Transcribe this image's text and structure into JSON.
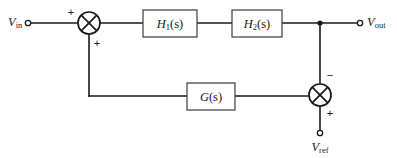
{
  "diagram": {
    "background_color": "#ffffff",
    "line_color": "#1a1a1a",
    "block_stroke_color": "#3c3c3c",
    "blocks": [
      {
        "id": "h1",
        "fn": "H",
        "sub": "1",
        "arg": "(s)",
        "label": "H1(s)"
      },
      {
        "id": "h2",
        "fn": "H",
        "sub": "2",
        "arg": "(s)",
        "label": "H2(s)"
      },
      {
        "id": "g",
        "fn": "G",
        "sub": "",
        "arg": "(s)",
        "label": "G(s)"
      }
    ],
    "signals": [
      {
        "id": "vin",
        "symbol": "V",
        "sub": "in",
        "label": "Vin"
      },
      {
        "id": "vout",
        "symbol": "V",
        "sub": "out",
        "label": "Vout"
      },
      {
        "id": "vref",
        "symbol": "V",
        "sub": "ref",
        "label": "Vref"
      }
    ],
    "summing_junctions": [
      {
        "id": "upper",
        "signs": [
          {
            "position": "left",
            "sign": "+"
          },
          {
            "position": "bottom",
            "sign": "+"
          }
        ]
      },
      {
        "id": "lower",
        "signs": [
          {
            "position": "top",
            "sign": "−"
          },
          {
            "position": "bottom",
            "sign": "+"
          }
        ]
      }
    ]
  }
}
